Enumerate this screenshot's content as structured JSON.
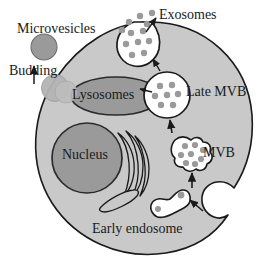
{
  "figure": {
    "background_color": "#ffffff"
  },
  "colors": {
    "cytoplasm": "#c9c9c9",
    "cytoplasm_outline": "#1a1a1a",
    "nucleus_fill": "#9a9a9a",
    "nucleus_outline": "#2b2b2b",
    "lysosome_fill": "#9a9a9a",
    "lysosome_outline": "#2b2b2b",
    "vesicle_fill": "#ffffff",
    "vesicle_outline": "#1a1a1a",
    "cargo_dot": "#9a9a9a",
    "microvesicle_fill": "#9a9a9a",
    "budding_fill": "#b4b4b4",
    "arrow": "#1a1a1a",
    "text": "#1a1a1a"
  },
  "labels": {
    "microvesicles": "Microvesicles",
    "budding": "Budding",
    "exosomes": "Exosomes",
    "late_mvb": "Late MVB",
    "mvb": "MVB",
    "lysosomes": "Lysosomes",
    "nucleus": "Nucleus",
    "early_endosome": "Early endosome"
  },
  "structures": [
    {
      "name": "cell-body",
      "type": "cell",
      "note": "large gray circle with endocytic invagination notch at lower right"
    },
    {
      "name": "nucleus",
      "type": "organelle",
      "shape": "circle",
      "fill": "#9a9a9a"
    },
    {
      "name": "golgi-apparatus",
      "type": "organelle",
      "shape": "stacked-cisternae",
      "fill": "#c9c9c9"
    },
    {
      "name": "lysosomes",
      "type": "organelle",
      "shape": "ellipse",
      "fill": "#9a9a9a"
    },
    {
      "name": "early-endosome",
      "type": "vesicle",
      "shape": "irregular-blob",
      "cargo_dots": 2
    },
    {
      "name": "mvb",
      "type": "vesicle",
      "shape": "lobed-blob",
      "cargo_dots": 8
    },
    {
      "name": "late-mvb",
      "type": "vesicle",
      "shape": "circle",
      "cargo_dots": 7
    },
    {
      "name": "exosome-release-vesicle",
      "type": "vesicle",
      "shape": "circle-fusing-membrane",
      "cargo_dots": 7
    },
    {
      "name": "released-exosomes",
      "type": "particles",
      "count": 5
    },
    {
      "name": "microvesicle",
      "type": "particle",
      "shape": "circle",
      "fill": "#9a9a9a"
    },
    {
      "name": "budding-microvesicle",
      "type": "particle",
      "shape": "circle",
      "fill": "#b4b4b4"
    }
  ],
  "arrows": [
    {
      "name": "arrow-endocytosis",
      "from": "plasma-membrane-invagination",
      "to": "early-endosome"
    },
    {
      "name": "arrow-early-to-mvb",
      "from": "early-endosome",
      "to": "mvb"
    },
    {
      "name": "arrow-mvb-to-late-mvb",
      "from": "mvb",
      "to": "late-mvb"
    },
    {
      "name": "arrow-late-mvb-to-lysosomes",
      "from": "late-mvb",
      "to": "lysosomes"
    },
    {
      "name": "arrow-late-mvb-to-membrane",
      "from": "late-mvb",
      "to": "plasma-membrane"
    },
    {
      "name": "arrow-exosome-release",
      "from": "exosome-release-vesicle",
      "to": "extracellular-space"
    },
    {
      "name": "arrow-budding",
      "from": "plasma-membrane",
      "to": "microvesicle"
    }
  ]
}
